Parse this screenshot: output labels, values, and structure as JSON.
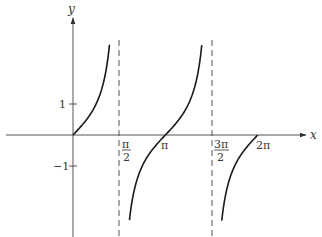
{
  "chart_data": {
    "type": "line",
    "title": "",
    "function": "y = tan(x)",
    "xlabel": "x",
    "ylabel": "y",
    "xlim": [
      -2.5,
      8.0
    ],
    "ylim": [
      -3.2,
      3.0
    ],
    "grid": false,
    "legend": null,
    "x_ticks": [
      {
        "value": 1.5708,
        "label_num": "π",
        "label_den": "2"
      },
      {
        "value": 3.1416,
        "label": "π"
      },
      {
        "value": 4.7124,
        "label_num": "3π",
        "label_den": "2"
      },
      {
        "value": 6.2832,
        "label": "2π"
      }
    ],
    "y_ticks": [
      {
        "value": 1,
        "label": "1"
      },
      {
        "value": -1,
        "label": "−1"
      }
    ],
    "asymptotes": [
      1.5708,
      4.7124
    ],
    "series": [
      {
        "name": "branch-1",
        "x_range": [
          0,
          1.24
        ],
        "description": "tan(x) from 0 rising toward +∞ near π/2"
      },
      {
        "name": "branch-2",
        "x_range": [
          1.92,
          4.38
        ],
        "description": "tan(x) from −∞ after π/2 through π to +∞ near 3π/2"
      },
      {
        "name": "branch-3",
        "x_range": [
          5.06,
          6.2832
        ],
        "description": "tan(x) from −∞ after 3π/2 up to 0 at 2π"
      }
    ],
    "zeros": [
      0,
      3.1416,
      6.2832
    ]
  },
  "labels": {
    "x_axis": "x",
    "y_axis": "y",
    "tick_one": "1",
    "tick_neg_one": "−1",
    "pi_half_num": "π",
    "pi_half_den": "2",
    "pi": "π",
    "three_pi_half_num": "3π",
    "three_pi_half_den": "2",
    "two_pi": "2π"
  },
  "colors": {
    "curve": "#1a1a1a",
    "axis": "#444444",
    "asymptote": "#555555"
  }
}
